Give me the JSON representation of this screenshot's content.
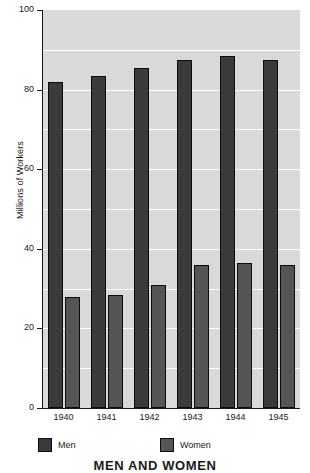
{
  "chart_data": {
    "type": "bar",
    "title": "MEN AND WOMEN",
    "xlabel": "",
    "ylabel": "Millions of Workers",
    "categories": [
      "1940",
      "1941",
      "1942",
      "1943",
      "1944",
      "1945"
    ],
    "series": [
      {
        "name": "Men",
        "color": "#3a3a3a",
        "values": [
          82,
          83.5,
          85.5,
          87.5,
          88.5,
          87.5
        ]
      },
      {
        "name": "Women",
        "color": "#555555",
        "values": [
          28,
          28.5,
          31,
          36,
          36.5,
          36
        ]
      }
    ],
    "ylim": [
      0,
      100
    ],
    "yticks": [
      "0",
      "20",
      "40",
      "60",
      "80",
      "100"
    ],
    "ytick_values": [
      0,
      20,
      40,
      60,
      80,
      100
    ],
    "gridlines": [
      10,
      20,
      30,
      40,
      50,
      60,
      70,
      80,
      90
    ],
    "grid": true,
    "grid_color": "#ffffff",
    "plot_background": "#d9d9d9",
    "legend_position": "bottom"
  },
  "legend": {
    "entries": [
      {
        "label": "Men",
        "swatch": "men"
      },
      {
        "label": "Women",
        "swatch": "women"
      }
    ]
  }
}
